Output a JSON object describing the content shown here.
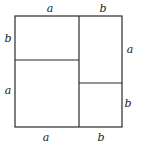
{
  "diagram": {
    "labels": {
      "top": [
        "a",
        "b"
      ],
      "left": [
        "b",
        "a"
      ],
      "right": [
        "a",
        "b"
      ],
      "bottom": [
        "a",
        "b"
      ]
    },
    "colors": {
      "stroke": "#2a2a2a",
      "text": "#222222",
      "background": "#ffffff"
    }
  }
}
